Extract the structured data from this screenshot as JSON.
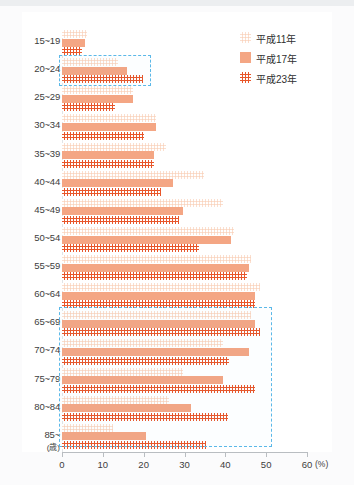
{
  "figure": {
    "title_partial": "",
    "x_unit": "(%)",
    "y_unit": "(歳)"
  },
  "legend": {
    "position": "top-right",
    "items": [
      {
        "label": "平成11年",
        "color": "#fdeadf",
        "pattern": "dotted"
      },
      {
        "label": "平成17年",
        "color": "#f4a684",
        "pattern": "solid"
      },
      {
        "label": "平成23年",
        "color": "#e8562a",
        "pattern": "dotted"
      }
    ]
  },
  "xaxis": {
    "ticks": [
      "0",
      "10",
      "20",
      "30",
      "40",
      "50",
      "60"
    ],
    "unit": "(%)",
    "min": 0,
    "max": 60
  },
  "chart_data": {
    "type": "bar",
    "orientation": "horizontal",
    "title": "",
    "xlabel": "(%)",
    "ylabel": "(歳)",
    "xlim": [
      0,
      60
    ],
    "grid": false,
    "legend_position": "top-right",
    "categories": [
      "15~19",
      "20~24",
      "25~29",
      "30~34",
      "35~39",
      "40~44",
      "45~49",
      "50~54",
      "55~59",
      "60~64",
      "65~69",
      "70~74",
      "75~79",
      "80~84",
      "85~"
    ],
    "series": [
      {
        "name": "平成11年",
        "color": "#fdeadf",
        "values": [
          6.2,
          13.8,
          17.5,
          23.0,
          25.4,
          34.8,
          39.5,
          42.2,
          46.4,
          48.4,
          46.4,
          39.5,
          29.6,
          26.2,
          12.6
        ]
      },
      {
        "name": "平成17年",
        "color": "#f4a684",
        "values": [
          5.7,
          16.0,
          17.5,
          23.0,
          22.5,
          27.2,
          29.6,
          41.5,
          45.9,
          47.2,
          47.2,
          45.9,
          39.5,
          31.6,
          20.5
        ]
      },
      {
        "name": "平成23年",
        "color": "#e8562a",
        "values": [
          4.9,
          19.8,
          13.1,
          20.0,
          22.5,
          24.2,
          28.6,
          33.6,
          45.2,
          47.2,
          48.4,
          41.0,
          47.2,
          40.7,
          35.3
        ]
      }
    ],
    "highlights": [
      {
        "categories": [
          "20~24"
        ],
        "note": "dashed blue box"
      },
      {
        "categories": [
          "65~69",
          "70~74",
          "75~79",
          "80~84",
          "85~"
        ],
        "note": "dashed blue box"
      }
    ]
  }
}
